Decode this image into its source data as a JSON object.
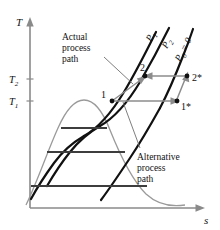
{
  "figure": {
    "name": "temperature-entropy-diagram",
    "axes": {
      "y_label": "T",
      "x_label": "s",
      "y_ticks": [
        {
          "label": "T",
          "sub": "2"
        },
        {
          "label": "T",
          "sub": "1"
        }
      ]
    },
    "pressure_lines": [
      {
        "id": "p1",
        "label": "P",
        "sub": "1",
        "suffix": ""
      },
      {
        "id": "p2",
        "label": "P",
        "sub": "2",
        "suffix": ""
      },
      {
        "id": "p0",
        "label": "P",
        "sub": "0",
        "suffix": " = 0"
      }
    ],
    "states": [
      {
        "id": "state-1",
        "label": "1"
      },
      {
        "id": "state-2",
        "label": "2"
      },
      {
        "id": "state-1-star",
        "label": "1*"
      },
      {
        "id": "state-2-star",
        "label": "2*"
      }
    ],
    "annotations": [
      {
        "id": "actual-process-path",
        "lines": [
          "Actual",
          "process",
          "path"
        ]
      },
      {
        "id": "alternative-process-path",
        "lines": [
          "Alternative",
          "process",
          "path"
        ]
      }
    ],
    "colors": {
      "isobar": "#111111",
      "dome": "#9a9a9a",
      "axis": "#8a8a8a",
      "process_arrow": "#8c8c8c",
      "saturation_line": "#3d3d3d",
      "background": "#ffffff"
    }
  }
}
